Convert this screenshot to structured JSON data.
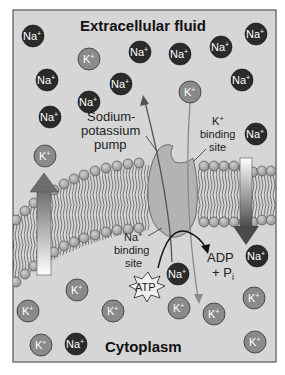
{
  "regions": {
    "top_label": "Extracellular fluid",
    "bottom_label": "Cytoplasm"
  },
  "pump": {
    "label_line1": "Sodium-",
    "label_line2": "potassium",
    "label_line3": "pump"
  },
  "k_binding": {
    "line1": "K",
    "sup": "+",
    "line2": "binding",
    "line3": "site"
  },
  "na_binding": {
    "line1": "Na",
    "sup": "+",
    "line2": "binding",
    "line3": "site"
  },
  "atp": {
    "label": "ATP"
  },
  "products": {
    "line1": "ADP",
    "line2": "+ P",
    "sub": "i"
  },
  "ions": {
    "na_label": "Na",
    "k_label": "K",
    "charge": "+"
  },
  "colors": {
    "background": "#d6d6d6",
    "frame": "#555555",
    "na_ion": "#2b2b2b",
    "k_ion": "#8a8a8a",
    "pump": "#b5b5b5",
    "lipid_head": "#a9a9a9"
  }
}
